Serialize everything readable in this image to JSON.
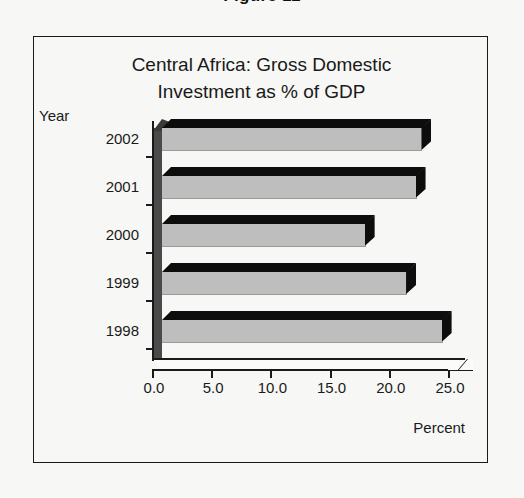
{
  "page": {
    "top_cut_text": "Figure 11"
  },
  "figure": {
    "title_line_1": "Central Africa: Gross Domestic",
    "title_line_2": "Investment as % of GDP",
    "y_axis_title": "Year",
    "x_axis_title": "Percent"
  },
  "colors": {
    "bar_fill": "#bebebe",
    "bar_shadow": "#0d0d0d",
    "axis": "#1a1a1a",
    "background": "#f7f7f5",
    "wall": "#4a4a4a"
  },
  "chart_data": {
    "type": "bar",
    "orientation": "horizontal",
    "title": "Central Africa: Gross Domestic Investment as % of GDP",
    "xlabel": "Percent",
    "ylabel": "Year",
    "categories": [
      "2002",
      "2001",
      "2000",
      "1999",
      "1998"
    ],
    "values": [
      22.0,
      21.5,
      17.2,
      20.7,
      23.7
    ],
    "xlim": [
      0.0,
      25.0
    ],
    "xticks": [
      0.0,
      5.0,
      10.0,
      15.0,
      20.0,
      25.0
    ],
    "xtick_labels": [
      "0.0",
      "5.0",
      "10.0",
      "15.0",
      "20.0",
      "25.0"
    ],
    "grid": false,
    "legend": null,
    "style": "3d-bar"
  }
}
